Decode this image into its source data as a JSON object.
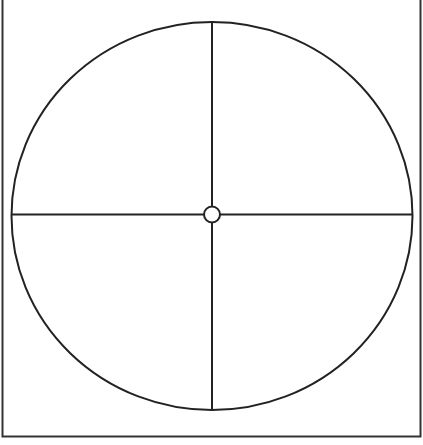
{
  "diagram": {
    "shapes": [
      "frame",
      "outer-circle",
      "vertical-diameter",
      "horizontal-diameter",
      "center-point"
    ],
    "stroke_color": "#222222",
    "fill_color": "#ffffff",
    "quadrant_count": 4
  }
}
